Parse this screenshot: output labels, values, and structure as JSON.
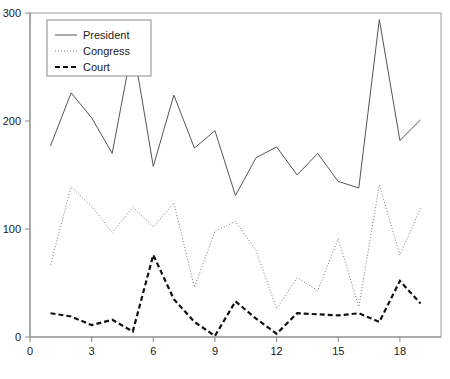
{
  "chart_data": {
    "type": "line",
    "title": "",
    "xlabel": "",
    "ylabel": "",
    "xlim": [
      0,
      20
    ],
    "ylim": [
      0,
      300
    ],
    "xticks": [
      0,
      3,
      6,
      9,
      12,
      15,
      18
    ],
    "yticks": [
      0,
      100,
      200,
      300
    ],
    "grid": false,
    "legend_position": "top-left",
    "x": [
      1,
      2,
      3,
      4,
      5,
      6,
      7,
      8,
      9,
      10,
      11,
      12,
      13,
      14,
      15,
      16,
      17,
      18,
      19
    ],
    "series": [
      {
        "name": "President",
        "style": "solid",
        "color": "#555555",
        "values": [
          177,
          226,
          203,
          170,
          271,
          158,
          224,
          175,
          191,
          131,
          166,
          176,
          150,
          170,
          144,
          138,
          294,
          182,
          201
        ]
      },
      {
        "name": "Congress",
        "style": "dotted",
        "color": "#777777",
        "values": [
          67,
          139,
          121,
          97,
          120,
          102,
          124,
          46,
          98,
          107,
          80,
          26,
          55,
          43,
          91,
          28,
          141,
          76,
          119
        ]
      },
      {
        "name": "Court",
        "style": "dashed",
        "color": "#111111",
        "values": [
          22,
          19,
          11,
          16,
          5,
          76,
          35,
          14,
          1,
          33,
          17,
          3,
          22,
          21,
          20,
          22,
          14,
          52,
          31
        ]
      }
    ],
    "legend_entries": [
      {
        "label": "President",
        "style": "solid"
      },
      {
        "label": "Congress",
        "style": "dotted"
      },
      {
        "label": "Court",
        "style": "dashed"
      }
    ]
  },
  "axis": {
    "x_tick_labels": [
      "0",
      "3",
      "6",
      "9",
      "12",
      "15",
      "18"
    ],
    "y_tick_labels": [
      "0",
      "100",
      "200",
      "300"
    ]
  },
  "colors": {
    "axis": "#888888",
    "border": "#999999",
    "text": "#1a1a1a",
    "president": "#555555",
    "congress": "#777777",
    "court": "#111111",
    "background": "#ffffff"
  }
}
